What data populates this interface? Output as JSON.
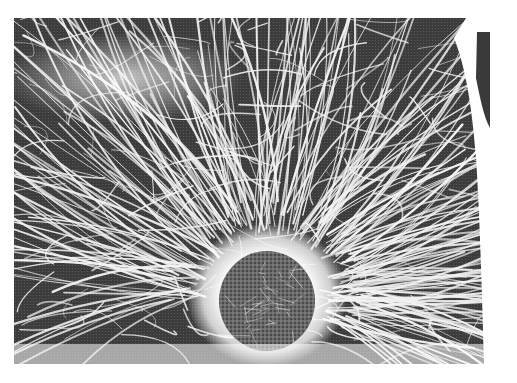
{
  "image": {
    "subject": "fluorescence micrograph of a cell's microtubule cytoskeleton radiating from the nucleus",
    "style": "halftone grayscale print",
    "colors": {
      "background": "#ffffff",
      "cytoplasm_dark": "#3a3a3a",
      "filament": "#f4f4f4",
      "nucleus": "#5a5a5a",
      "halo": "#ffffff"
    },
    "regions": [
      "filament-network",
      "perinuclear-halo",
      "nucleus",
      "right-edge-dark-strip"
    ]
  },
  "caption": {
    "text": ""
  }
}
